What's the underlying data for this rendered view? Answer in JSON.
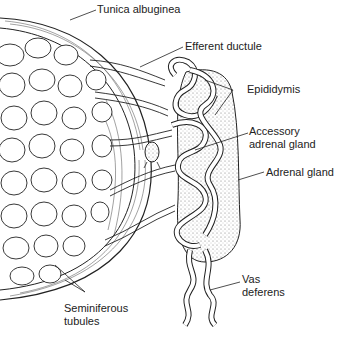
{
  "diagram": {
    "type": "anatomical illustration",
    "labels": {
      "tunica": "Tunica albuginea",
      "efferent": "Efferent ductule",
      "epididymis": "Epididymis",
      "accessory_l1": "Accessory",
      "accessory_l2": "adrenal gland",
      "adrenal": "Adrenal gland",
      "vas_l1": "Vas",
      "vas_l2": "deferens",
      "semi_l1": "Seminiferous",
      "semi_l2": "tubules"
    }
  }
}
